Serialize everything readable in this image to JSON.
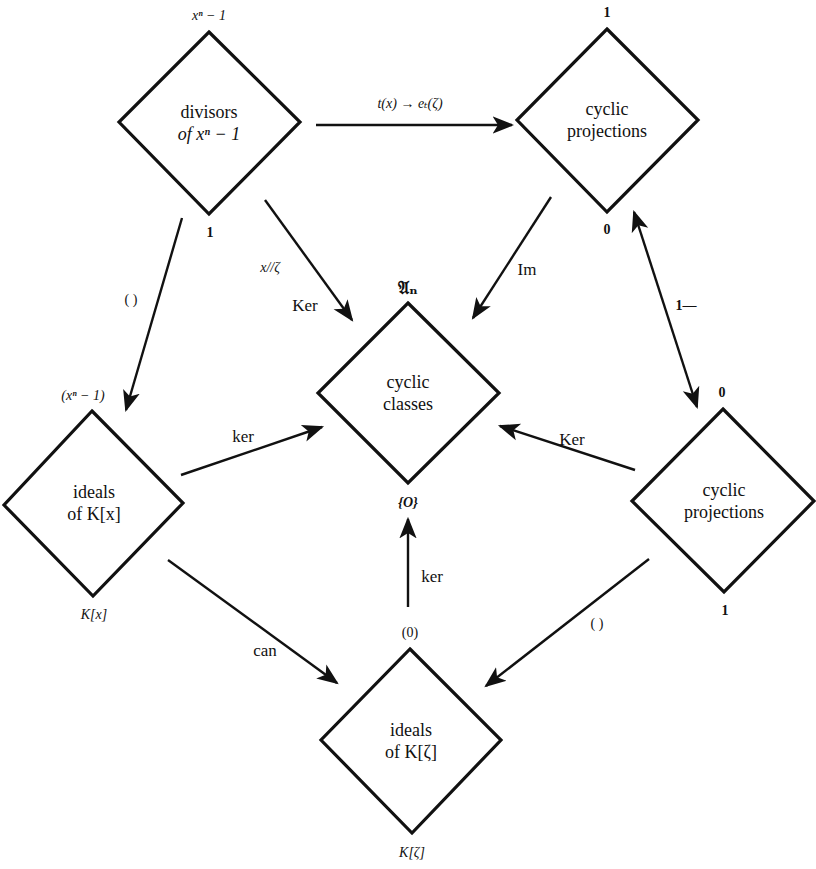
{
  "nodes": {
    "divisors": {
      "line1": "divisors",
      "line2": "of xⁿ − 1",
      "top_label": "xⁿ − 1",
      "bottom_label": "1"
    },
    "cyclic_projections_top": {
      "line1": "cyclic",
      "line2": "projections",
      "top_label": "1",
      "bottom_label": "0"
    },
    "cyclic_classes": {
      "line1": "cyclic",
      "line2": "classes",
      "top_label": "𝔄ₙ",
      "bottom_label": "{O}"
    },
    "ideals_kx": {
      "line1": "ideals",
      "line2": "of K[x]",
      "top_label": "(xⁿ − 1)",
      "bottom_label": "K[x]"
    },
    "cyclic_projections_right": {
      "line1": "cyclic",
      "line2": "projections",
      "top_label": "0",
      "bottom_label": "1"
    },
    "ideals_kzeta": {
      "line1": "ideals",
      "line2": "of K[ζ]",
      "top_label": "(0)",
      "bottom_label": "K[ζ]"
    }
  },
  "edges": {
    "divisors_to_projections": {
      "label": "t(x) → eₜ(ζ)"
    },
    "divisors_to_classes": {
      "label1": "x//ζ",
      "label2": "Ker"
    },
    "projections_to_classes": {
      "label": "Im"
    },
    "divisors_to_ideals_kx": {
      "label": "(   )"
    },
    "projections_complement": {
      "label": "1—"
    },
    "ideals_kx_to_classes": {
      "label": "ker"
    },
    "projections_right_to_classes": {
      "label": "Ker"
    },
    "ideals_kx_to_ideals_kzeta": {
      "label": "can"
    },
    "projections_right_to_ideals_kzeta": {
      "label": "(   )"
    },
    "ideals_kzeta_to_classes": {
      "label": "ker"
    }
  },
  "colors": {
    "stroke": "#111111",
    "background": "#ffffff"
  }
}
